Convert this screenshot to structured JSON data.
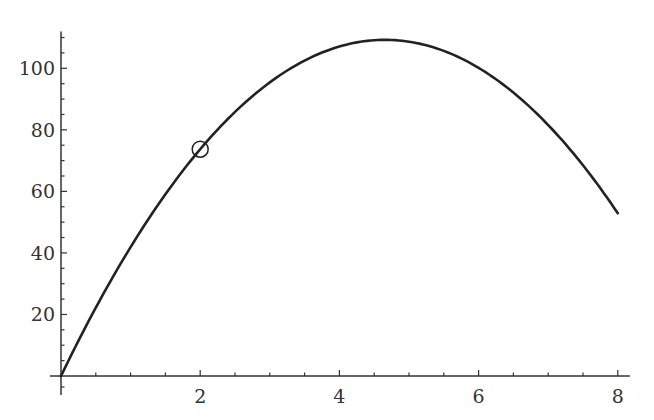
{
  "chart_data": {
    "type": "line",
    "title": "",
    "xlabel": "",
    "ylabel": "",
    "xlim": [
      0,
      8
    ],
    "ylim": [
      0,
      112
    ],
    "x_ticks": [
      2,
      4,
      6,
      8
    ],
    "x_tick_labels": [
      "2",
      "4",
      "6",
      "8"
    ],
    "y_ticks": [
      20,
      40,
      60,
      80,
      100
    ],
    "y_tick_labels": [
      "20",
      "40",
      "60",
      "80",
      "100"
    ],
    "x_minor_step": 0.5,
    "y_minor_step": 5,
    "grid": false,
    "legend": null,
    "series": [
      {
        "name": "curve",
        "color": "#222222",
        "formula": "y = 46.93x - 5.04x^2",
        "x": [
          0,
          0.5,
          1,
          1.5,
          2,
          2.5,
          3,
          3.5,
          4,
          4.5,
          5,
          5.5,
          6,
          6.5,
          7,
          7.5,
          8
        ],
        "values": [
          0,
          22.2,
          41.9,
          59.1,
          73.7,
          85.8,
          95.4,
          102.5,
          107.1,
          109.1,
          108.7,
          105.6,
          100.1,
          92.1,
          85.5,
          68.5,
          53.0
        ]
      }
    ],
    "annotations": [
      {
        "type": "circle-marker",
        "x": 2,
        "y": 73.7
      }
    ]
  }
}
